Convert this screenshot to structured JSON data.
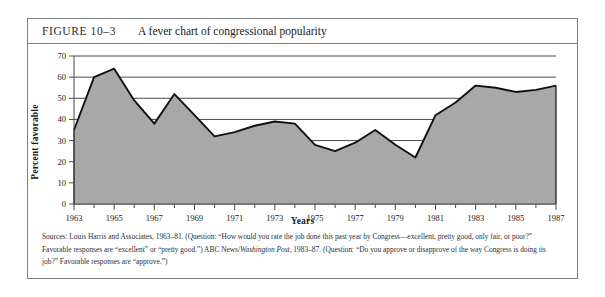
{
  "figure": {
    "number": "FIGURE 10–3",
    "title": "A fever chart of congressional popularity"
  },
  "source_note": {
    "prefix": "Sources: Louis Harris and Associates, 1963–81. (Question: “How would you rate the job done this past year by Congress—excellent, pretty good, only fair, or poor?” Favorable responses are “excellent” or “pretty good.”) ABC News/",
    "italic": "Washington Post",
    "suffix": ", 1983–87. (Question: “Do you approve or disapprove of the way Congress is doing its job?” Favorable responses are “approve.”)"
  },
  "style": {
    "area_fill": "#a8a8a8",
    "line_color": "#111111",
    "grid_color": "#4a4a4a",
    "frame_color": "#7d7f86"
  },
  "chart_data": {
    "type": "area",
    "title": "A fever chart of congressional popularity",
    "xlabel": "Years",
    "ylabel": "Percent favorable",
    "ylim": [
      0,
      70
    ],
    "xlim": [
      1963,
      1987
    ],
    "ytick_step": 10,
    "yticks": [
      0,
      10,
      20,
      30,
      40,
      50,
      60,
      70
    ],
    "xticks": [
      1963,
      1965,
      1967,
      1969,
      1971,
      1973,
      1975,
      1977,
      1979,
      1981,
      1983,
      1985,
      1987
    ],
    "xtick_minor_step": 1,
    "grid": "horizontal",
    "legend": "none",
    "x": [
      1963,
      1964,
      1965,
      1966,
      1967,
      1968,
      1969,
      1970,
      1971,
      1972,
      1973,
      1974,
      1975,
      1976,
      1977,
      1978,
      1979,
      1980,
      1981,
      1982,
      1983,
      1984,
      1985,
      1986,
      1987
    ],
    "values": [
      35,
      60,
      64,
      49,
      38,
      52,
      42,
      32,
      34,
      37,
      39,
      38,
      28,
      25,
      29,
      35,
      28,
      22,
      42,
      48,
      56,
      55,
      53,
      54,
      56
    ],
    "series": [
      {
        "name": "Percent favorable",
        "values": [
          35,
          60,
          64,
          49,
          38,
          52,
          42,
          32,
          34,
          37,
          39,
          38,
          28,
          25,
          29,
          35,
          28,
          22,
          42,
          48,
          56,
          55,
          53,
          54,
          56
        ]
      }
    ]
  }
}
